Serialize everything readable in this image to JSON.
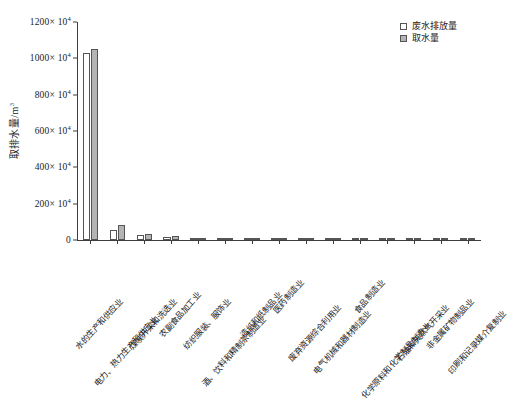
{
  "chart_data": {
    "type": "bar",
    "title": "",
    "xlabel": "",
    "ylabel": "取排水量/m",
    "ylabel_sup": "3",
    "ylim": [
      0,
      1200
    ],
    "y_unit_suffix": "× 10",
    "y_unit_exponent": "4",
    "ytick_values": [
      0,
      200,
      400,
      600,
      800,
      1000,
      1200
    ],
    "ytick_labels": [
      "0",
      "200",
      "400",
      "600",
      "800",
      "1000",
      "1200"
    ],
    "grid": false,
    "legend_position": "top-right",
    "categories": [
      "水的生产和供应业",
      "电力、热力生产和供应业",
      "煤炭开采和洗选业",
      "农副食品加工业",
      "纺织服装、服饰业",
      "酒、饮料和精制茶制造业",
      "造纸和纸制品业",
      "医药制造业",
      "废弃资源综合利用业",
      "电气机械和器材制造业",
      "食品制造业",
      "化学原料和化学制品制造业",
      "石油和天然气开采业",
      "非金属矿物制品业",
      "印刷和记录媒介复制业"
    ],
    "series": [
      {
        "name": "废水排放量",
        "color": "#ffffff",
        "values": [
          1030,
          55,
          28,
          16,
          10,
          7,
          5,
          4,
          3,
          2.5,
          2,
          2,
          7,
          3,
          1
        ]
      },
      {
        "name": "取水量",
        "color": "#b4b4b4",
        "values": [
          1050,
          85,
          35,
          20,
          13,
          9,
          7,
          5,
          4,
          3,
          3,
          2.5,
          5,
          4,
          2
        ]
      }
    ]
  },
  "legend": {
    "items": [
      {
        "label": "废水排放量",
        "swatch": "discharge"
      },
      {
        "label": "取水量",
        "swatch": "intake"
      }
    ]
  }
}
